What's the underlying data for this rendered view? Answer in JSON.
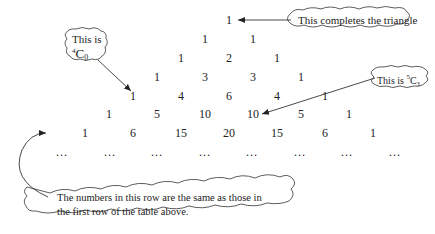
{
  "diagram": {
    "rows": [
      [
        "1"
      ],
      [
        "1",
        "1"
      ],
      [
        "1",
        "2",
        "1"
      ],
      [
        "1",
        "3",
        "3",
        "1"
      ],
      [
        "1",
        "4",
        "6",
        "4",
        "1"
      ],
      [
        "1",
        "5",
        "10",
        "10",
        "5",
        "1"
      ],
      [
        "1",
        "6",
        "15",
        "20",
        "15",
        "6",
        "1"
      ]
    ],
    "continuation_row": [
      "…",
      "…",
      "…",
      "…",
      "…",
      "…",
      "…",
      "…"
    ],
    "callouts": {
      "top": {
        "text": "This completes the triangle"
      },
      "left": {
        "line1": "This is",
        "sup": "4",
        "base": "C",
        "sub": "0"
      },
      "right": {
        "prefix": "This is ",
        "sup": "5",
        "base": "C",
        "sub": "3"
      },
      "bottom": {
        "line1": "The numbers in this row are the same as those in",
        "line2": "the first row of the table above."
      }
    }
  }
}
